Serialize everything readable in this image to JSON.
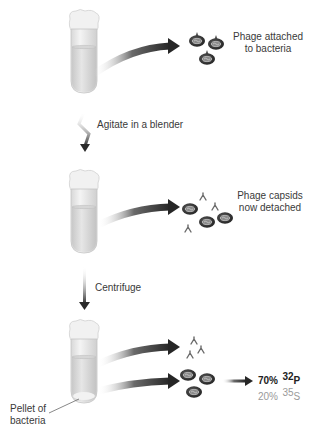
{
  "steps": [
    {
      "id": "step1",
      "result_label": "Phage attached to bacteria",
      "result_lines": [
        "Phage attached",
        "to bacteria"
      ]
    },
    {
      "id": "step2",
      "action_label": "Agitate in a blender",
      "result_label": "Phage capsids now detached",
      "result_lines": [
        "Phage capsids",
        "now detached"
      ]
    },
    {
      "id": "step3",
      "action_label": "Centrifuge",
      "pellet_label_lines": [
        "Pellet of",
        "bacteria"
      ],
      "results": {
        "p32": {
          "percent": "70%",
          "isotope_mass": "32",
          "element": "P"
        },
        "s35": {
          "percent": "20%",
          "isotope_mass": "35",
          "element": "S"
        }
      }
    }
  ],
  "colors": {
    "arrow_dark": "#2e2e2e",
    "tube_fill": "#e2e2e2",
    "tube_outline": "#bdbdbd",
    "bacteria": "#2b2b2b",
    "text": "#3a3a3a",
    "text_muted": "#9a9a9a"
  }
}
